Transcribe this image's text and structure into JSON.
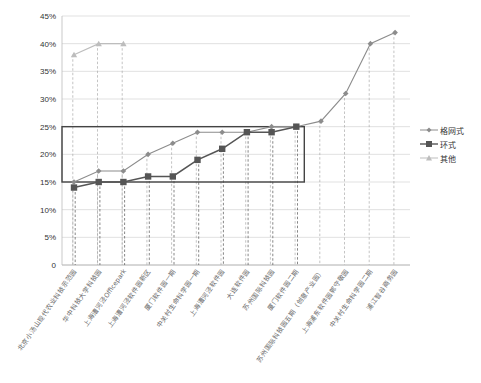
{
  "chart_data": {
    "type": "line",
    "title": "",
    "xlabel": "",
    "ylabel": "",
    "ylim": [
      0,
      0.45
    ],
    "yticks": [
      "0",
      "5%",
      "10%",
      "15%",
      "20%",
      "25%",
      "30%",
      "35%",
      "40%",
      "45%"
    ],
    "grid": true,
    "legend_position": "right",
    "categories": [
      "北京小汤山现代农业科技示范园",
      "华中科技大学科技园",
      "上海漕河泾Officepark",
      "上海漕河泾软件园新区",
      "厦门软件园一期",
      "中关村生命科学园一期",
      "上海漕河泾软件园",
      "大连软件园",
      "苏州国际科技园",
      "厦门软件园二期",
      "苏州国际科技园五期（创意产业园）",
      "上海浦东软件园郭守敬园",
      "中关村生命科学园二期",
      "浦江智谷商务园"
    ],
    "series": [
      {
        "name": "格网式",
        "color": "#8c8c8c",
        "marker": "diamond",
        "values": [
          0.15,
          0.17,
          0.17,
          0.2,
          0.22,
          0.24,
          0.24,
          0.24,
          0.25,
          0.25,
          0.26,
          0.31,
          0.4,
          0.42
        ]
      },
      {
        "name": "环式",
        "color": "#555555",
        "marker": "square",
        "values": [
          0.14,
          0.15,
          0.15,
          0.16,
          0.16,
          0.19,
          0.21,
          0.24,
          0.24,
          0.25,
          null,
          null,
          null,
          null
        ]
      },
      {
        "name": "其他",
        "color": "#bdbdbd",
        "marker": "triangle",
        "values": [
          0.38,
          0.4,
          0.4,
          null,
          null,
          null,
          null,
          null,
          null,
          null,
          null,
          null,
          null,
          null
        ]
      }
    ],
    "annotations": [
      {
        "type": "rectangle",
        "y_from": 0.15,
        "y_to": 0.25,
        "x_from_index": 0,
        "x_to_index": 9,
        "label": "highlight band 15%–25%"
      }
    ]
  },
  "legend": {
    "items": [
      {
        "label": "格网式"
      },
      {
        "label": "环式"
      },
      {
        "label": "其他"
      }
    ]
  }
}
